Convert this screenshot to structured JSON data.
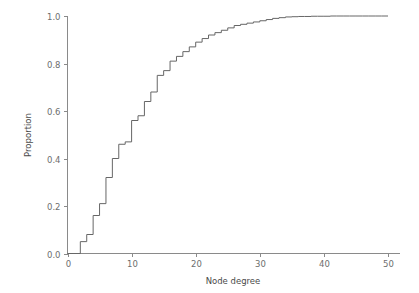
{
  "chart_data": {
    "type": "line",
    "subtype": "step-ecdf",
    "title": "",
    "subtitle": "",
    "xlabel": "Node degree",
    "ylabel": "Proportion",
    "xlim": [
      0,
      50
    ],
    "ylim": [
      0.0,
      1.0
    ],
    "xticks": [
      0,
      10,
      20,
      30,
      40,
      50
    ],
    "xtick_labels": [
      "0",
      "10",
      "20",
      "30",
      "40",
      "50"
    ],
    "yticks": [
      0.0,
      0.2,
      0.4,
      0.6,
      0.8,
      1.0
    ],
    "ytick_labels": [
      "0.0",
      "0.2",
      "0.4",
      "0.6",
      "0.8",
      "1.0"
    ],
    "grid": false,
    "legend": false,
    "legend_position": "none",
    "line_color": "#666666",
    "axis_color": "#8a8a8a",
    "background_color": "#ffffff",
    "annotations": [],
    "series": [
      {
        "name": "Cumulative proportion of nodes",
        "step_type": "post",
        "x": [
          0,
          1,
          2,
          3,
          4,
          5,
          6,
          7,
          8,
          9,
          10,
          11,
          12,
          13,
          14,
          15,
          16,
          17,
          18,
          19,
          20,
          21,
          22,
          23,
          24,
          25,
          26,
          27,
          28,
          29,
          30,
          31,
          32,
          33,
          34,
          35,
          36,
          37,
          38,
          39,
          40,
          41,
          42,
          43,
          44,
          45,
          46,
          47,
          48,
          49,
          50
        ],
        "values": [
          0.0,
          0.0,
          0.05,
          0.08,
          0.16,
          0.21,
          0.32,
          0.4,
          0.46,
          0.47,
          0.56,
          0.58,
          0.64,
          0.68,
          0.75,
          0.77,
          0.81,
          0.83,
          0.85,
          0.87,
          0.89,
          0.905,
          0.92,
          0.93,
          0.94,
          0.95,
          0.96,
          0.965,
          0.97,
          0.975,
          0.98,
          0.985,
          0.99,
          0.993,
          0.996,
          0.997,
          0.998,
          0.998,
          0.999,
          0.999,
          0.999,
          1.0,
          1.0,
          1.0,
          1.0,
          1.0,
          1.0,
          1.0,
          1.0,
          1.0,
          1.0
        ]
      }
    ]
  }
}
